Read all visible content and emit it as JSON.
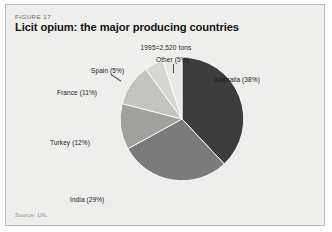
{
  "figure": {
    "label": "FIGURE 17",
    "title": "Licit opium: the major producing countries",
    "subtitle": "1995=2,520 tons",
    "source": "Source: UN."
  },
  "chart_data": {
    "type": "pie",
    "title": "Licit opium: the major producing countries",
    "subtitle": "1995=2,520 tons",
    "unit": "percent of total",
    "total_label": "1995=2,520 tons",
    "total_tons": 2520,
    "categories": [
      "Australia",
      "India",
      "Turkey",
      "France",
      "Spain",
      "Other"
    ],
    "values": [
      38,
      29,
      12,
      11,
      5,
      5
    ],
    "labels": [
      "Australia (38%)",
      "India (29%)",
      "Turkey (12%)",
      "France (11%)",
      "Spain (5%)",
      "Other (5%)"
    ],
    "colors": [
      "#3d3d3d",
      "#7b7b7b",
      "#a0a09c",
      "#c3c3bf",
      "#d6d6d2",
      "#e8e8e4"
    ],
    "legend": "none",
    "grid": false,
    "start_angle_deg": 0,
    "direction": "clockwise"
  },
  "colors": {
    "card_background": "#eeeeec",
    "card_border": "#b9b9b5",
    "title_text": "#141414",
    "label_text": "#6b6b68",
    "slice_outline": "#ffffff"
  }
}
